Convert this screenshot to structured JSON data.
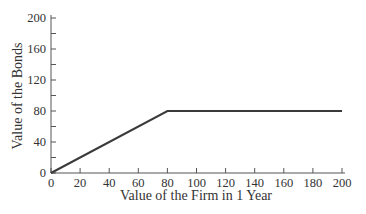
{
  "chart_data": {
    "type": "line",
    "title": "",
    "xlabel": "Value of the Firm in 1 Year",
    "ylabel": "Value of the Bonds",
    "xlim": [
      0,
      200
    ],
    "ylim": [
      0,
      200
    ],
    "x_ticks": [
      0,
      20,
      40,
      60,
      80,
      100,
      120,
      140,
      160,
      180,
      200
    ],
    "y_ticks": [
      0,
      40,
      80,
      120,
      160,
      200
    ],
    "y_minor_ticks": [
      20,
      60,
      100,
      140,
      180
    ],
    "grid": false,
    "legend": null,
    "series": [
      {
        "name": "Bond payoff",
        "x": [
          0,
          80,
          200
        ],
        "y": [
          0,
          80,
          80
        ],
        "color": "#3a3a3a"
      }
    ]
  },
  "labels": {
    "x_axis_title": "Value of the Firm in 1 Year",
    "y_axis_title": "Value of the Bonds"
  }
}
